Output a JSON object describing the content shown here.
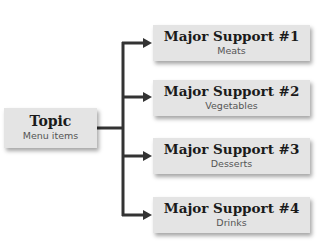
{
  "topic": {
    "title": "Topic",
    "subtitle": "Menu items"
  },
  "supports": [
    {
      "title": "Major Support #1",
      "subtitle": "Meats"
    },
    {
      "title": "Major Support #2",
      "subtitle": "Vegetables"
    },
    {
      "title": "Major Support #3",
      "subtitle": "Desserts"
    },
    {
      "title": "Major Support #4",
      "subtitle": "Drinks"
    }
  ],
  "colors": {
    "box_fill": "#e4e4e4",
    "connector": "#333333",
    "title_text": "#1a1a1a",
    "subtitle_text": "#555555"
  }
}
